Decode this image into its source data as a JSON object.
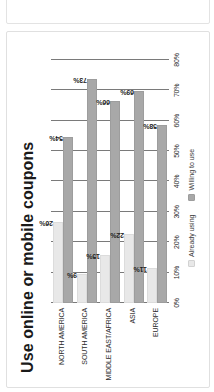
{
  "top_panel": {
    "truncated_label": "MID"
  },
  "chart_data": {
    "type": "bar",
    "orientation": "horizontal",
    "title": "Use online or mobile coupons",
    "xlabel": "",
    "ylabel": "",
    "categories": [
      "NORTH AMERICA",
      "SOUTH AMERICA",
      "MIDDLE EAST/AFRICA",
      "ASIA",
      "EUROPE"
    ],
    "series": [
      {
        "name": "Already using",
        "color": "#e8e8e8",
        "values": [
          26,
          9,
          15,
          22,
          11
        ],
        "value_labels": [
          "26%",
          "9%",
          "15%",
          "22%",
          "11%"
        ]
      },
      {
        "name": "Willing to use",
        "color": "#a8a8a8",
        "values": [
          54,
          73,
          66,
          69,
          58
        ],
        "value_labels": [
          "54%",
          "73%",
          "66%",
          "69%",
          "58%"
        ]
      }
    ],
    "xlim": [
      0,
      80
    ],
    "xticks": [
      0,
      10,
      20,
      30,
      40,
      50,
      60,
      70,
      80
    ],
    "xtick_labels": [
      "0%",
      "10%",
      "20%",
      "30%",
      "40%",
      "50%",
      "60%",
      "70%",
      "80%"
    ],
    "grid": true,
    "legend_position": "bottom",
    "legend": [
      "Already using",
      "Willing to use"
    ]
  }
}
